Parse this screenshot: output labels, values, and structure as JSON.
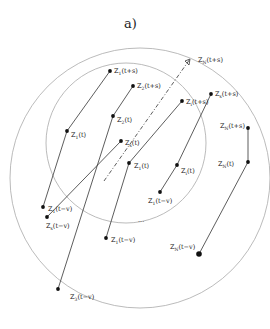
{
  "figure": {
    "title": "a)",
    "circles": [
      {
        "name": "outer-circle",
        "cx": 140,
        "cy": 178,
        "r": 130,
        "color": "#aaaaaa"
      },
      {
        "name": "inner-circle",
        "cx": 126,
        "cy": 143,
        "r": 80,
        "color": "#aaaaaa"
      }
    ],
    "trajectories": [
      {
        "id": "traj-1",
        "points": [
          {
            "x": 110,
            "y": 71,
            "label": "Z",
            "sub": "1",
            "arg": "(t+s)",
            "lx": 114,
            "ly": 73
          },
          {
            "x": 67,
            "y": 131,
            "label": "Z",
            "sub": "1",
            "arg": "(t)",
            "lx": 71,
            "ly": 137
          },
          {
            "x": 43,
            "y": 207,
            "label": "Z",
            "sub": "1",
            "arg": "(t−v)",
            "lx": 48,
            "ly": 211
          }
        ]
      },
      {
        "id": "traj-2",
        "points": [
          {
            "x": 133,
            "y": 86,
            "label": "Z",
            "sub": "2",
            "arg": "(t+s)",
            "lx": 137,
            "ly": 88
          },
          {
            "x": 113,
            "y": 116,
            "label": "Z",
            "sub": "2",
            "arg": "(t)",
            "lx": 117,
            "ly": 122
          },
          {
            "x": 58,
            "y": 289,
            "label": "Z",
            "sub": "3",
            "arg": "(t−v)",
            "lx": 70,
            "ly": 299
          }
        ]
      },
      {
        "id": "traj-3",
        "points": [
          {
            "x": 121,
            "y": 141,
            "label": "Z",
            "sub": "s",
            "arg": "(t)",
            "lx": 125,
            "ly": 145
          },
          {
            "x": 47,
            "y": 217,
            "label": "Z",
            "sub": "s",
            "arg": "(t−v)",
            "lx": 46,
            "ly": 228
          }
        ]
      },
      {
        "id": "traj-4",
        "points": [
          {
            "x": 182,
            "y": 101,
            "label": "Z",
            "sub": "i",
            "arg": "(t+s)",
            "lx": 186,
            "ly": 104
          },
          {
            "x": 129,
            "y": 163,
            "label": "Z",
            "sub": "1",
            "arg": "(t)",
            "lx": 134,
            "ly": 168
          },
          {
            "x": 106,
            "y": 238,
            "label": "Z",
            "sub": "1",
            "arg": "(t−v)",
            "lx": 111,
            "ly": 242
          }
        ]
      },
      {
        "id": "traj-5",
        "points": [
          {
            "x": 211,
            "y": 94,
            "label": "Z",
            "sub": "s",
            "arg": "(t+s)",
            "lx": 215,
            "ly": 96
          },
          {
            "x": 177,
            "y": 165,
            "label": "Z",
            "sub": "i",
            "arg": "(t)",
            "lx": 181,
            "ly": 173
          },
          {
            "x": 160,
            "y": 192,
            "label": "Z",
            "sub": "1",
            "arg": "(t−v)",
            "lx": 148,
            "ly": 203
          }
        ]
      },
      {
        "id": "traj-6",
        "points": [
          {
            "x": 248,
            "y": 128,
            "label": "Z",
            "sub": "N",
            "arg": "(t+s)",
            "lx": 220,
            "ly": 128
          },
          {
            "x": 248,
            "y": 162,
            "label": "Z",
            "sub": "N",
            "arg": "(t)",
            "lx": 218,
            "ly": 166
          },
          {
            "x": 199,
            "y": 254,
            "label": "Z",
            "sub": "N",
            "arg": "(t−v)",
            "lx": 170,
            "ly": 249
          }
        ]
      }
    ],
    "dashed_vector": {
      "from": {
        "x": 104,
        "y": 181
      },
      "to": {
        "x": 190,
        "y": 59
      },
      "label": "Z",
      "sub": "N",
      "arg": "(t+s)",
      "lx": 198,
      "ly": 62
    },
    "ellipsis": {
      "text": "...",
      "x": 138,
      "y": 222
    }
  }
}
